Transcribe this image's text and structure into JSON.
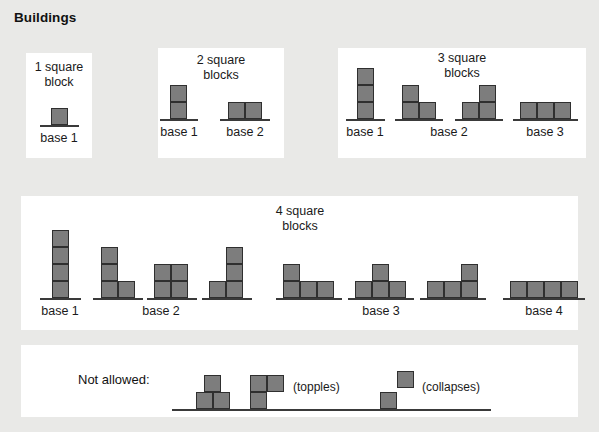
{
  "title": "Buildings",
  "block_color": "#7d7d7d",
  "block_border_color": "#2f2f2f",
  "panel_color": "#ffffff",
  "background_color": "#e9e9e7",
  "panels": [
    {
      "id": "one-block",
      "caption": "1 square\nblock",
      "groups": [
        {
          "label": "base 1",
          "columns": [
            1
          ]
        }
      ]
    },
    {
      "id": "two-blocks",
      "caption": "2 square\nblocks",
      "groups": [
        {
          "label": "base 1",
          "columns": [
            2
          ]
        },
        {
          "label": "base 2",
          "columns": [
            1,
            1
          ]
        }
      ]
    },
    {
      "id": "three-blocks",
      "caption": "3 square\nblocks",
      "groups": [
        {
          "label": "base 1",
          "columns": [
            3
          ]
        },
        {
          "label": "base 2",
          "columns": [
            2,
            1
          ]
        },
        {
          "label": "base 2",
          "columns": [
            1,
            2
          ]
        },
        {
          "label": "base 3",
          "columns": [
            1,
            1,
            1
          ]
        }
      ]
    },
    {
      "id": "four-blocks",
      "caption": "4 square\nblocks",
      "groups": [
        {
          "label": "base 1",
          "columns": [
            4
          ]
        },
        {
          "label": "base 2",
          "columns": [
            3,
            1
          ]
        },
        {
          "label": "base 2",
          "columns": [
            2,
            2
          ]
        },
        {
          "label": "base 2",
          "columns": [
            1,
            3
          ]
        },
        {
          "label": "base 3",
          "columns": [
            2,
            1,
            1
          ]
        },
        {
          "label": "base 3",
          "columns": [
            1,
            2,
            1
          ]
        },
        {
          "label": "base 3",
          "columns": [
            1,
            1,
            2
          ]
        },
        {
          "label": "base 4",
          "columns": [
            1,
            1,
            1,
            1
          ]
        }
      ]
    }
  ],
  "not_allowed": {
    "label": "Not allowed:",
    "examples": [
      {
        "annotation": "",
        "reason": "unstable-centered-top"
      },
      {
        "annotation": "(topples)",
        "reason": "overhang"
      },
      {
        "annotation": "(collapses)",
        "reason": "diagonal"
      }
    ]
  }
}
